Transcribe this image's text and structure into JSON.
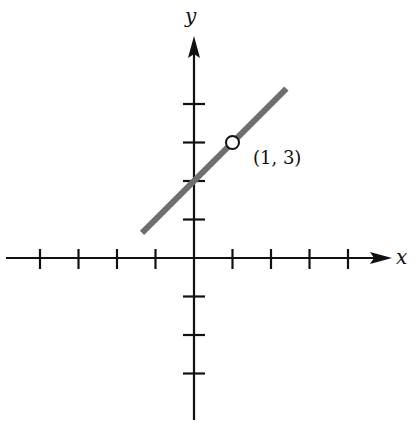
{
  "chart_data": {
    "type": "line",
    "title": "",
    "xlabel": "x",
    "ylabel": "y",
    "grid": false,
    "xlim": [
      -4.5,
      5
    ],
    "ylim": [
      -4.2,
      5.8
    ],
    "x_ticks": [
      -4,
      -3,
      -2,
      -1,
      1,
      2,
      3,
      4
    ],
    "y_ticks": [
      -3,
      -2,
      -1,
      1,
      2,
      3,
      4
    ],
    "tick_labels_shown": false,
    "series": [
      {
        "name": "line",
        "equation": "y = x + 2",
        "x": [
          -1.35,
          2.4
        ],
        "y": [
          0.65,
          4.4
        ],
        "color": "#6e6e6e"
      }
    ],
    "annotations": [
      {
        "type": "open-circle-point",
        "x": 1,
        "y": 3,
        "label": "(1, 3)"
      }
    ]
  },
  "labels": {
    "x_axis": "x",
    "y_axis": "y",
    "point": "(1, 3)"
  },
  "colors": {
    "axes": "#111111",
    "line": "#6e6e6e",
    "background": "#ffffff"
  }
}
